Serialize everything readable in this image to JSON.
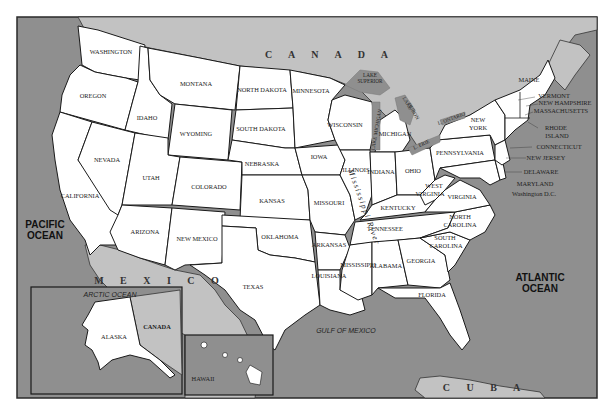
{
  "map": {
    "title": "United States",
    "colors": {
      "water": "#8f8f8f",
      "foreign_land": "#c2c2c2",
      "states": "#ffffff",
      "border": "#1a1a1a"
    },
    "countries": {
      "canada": "C A N A D A",
      "mexico": "M E X I C O",
      "cuba": "C U B A"
    },
    "oceans": {
      "pacific_line1": "PACIFIC",
      "pacific_line2": "OCEAN",
      "atlantic_line1": "ATLANTIC",
      "atlantic_line2": "OCEAN",
      "gulf": "GULF OF MEXICO"
    },
    "lakes": {
      "superior_line1": "LAKE",
      "superior_line2": "SUPERIOR",
      "michigan": "LAKE MICHIGAN",
      "huron_line1": "LAKE",
      "huron_line2": "HURON",
      "erie": "L. ERIE",
      "ontario": "L. ONTARIO"
    },
    "river": "Mississippi River",
    "states": {
      "washington": "WASHINGTON",
      "oregon": "OREGON",
      "california": "CALIFORNIA",
      "idaho": "IDAHO",
      "nevada": "NEVADA",
      "montana": "MONTANA",
      "wyoming": "WYOMING",
      "utah": "UTAH",
      "colorado": "COLORADO",
      "arizona": "ARIZONA",
      "new_mexico": "NEW MEXICO",
      "north_dakota": "NORTH DAKOTA",
      "south_dakota": "SOUTH DAKOTA",
      "nebraska": "NEBRASKA",
      "kansas": "KANSAS",
      "oklahoma": "OKLAHOMA",
      "texas": "TEXAS",
      "minnesota": "MINNESOTA",
      "iowa": "IOWA",
      "missouri": "MISSOURI",
      "arkansas": "ARKANSAS",
      "louisiana": "LOUISIANA",
      "wisconsin": "WISCONSIN",
      "illinois": "ILLINOIS",
      "michigan": "MICHIGAN",
      "indiana": "INDIANA",
      "ohio": "OHIO",
      "kentucky": "KENTUCKY",
      "tennessee": "TENNESSEE",
      "mississippi": "MISSISSIPPI",
      "alabama": "ALABAMA",
      "georgia": "GEORGIA",
      "florida": "FLORIDA",
      "south_carolina_line1": "SOUTH",
      "south_carolina_line2": "CAROLINA",
      "north_carolina_line1": "NORTH",
      "north_carolina_line2": "CAROLINA",
      "virginia": "VIRGINIA",
      "west_virginia_line1": "WEST",
      "west_virginia_line2": "VIRGINIA",
      "pennsylvania": "PENNSYLVANIA",
      "new_york_line1": "NEW",
      "new_york_line2": "YORK",
      "maine": "MAINE",
      "vermont": "VERMONT",
      "new_hampshire": "NEW HAMPSHIRE",
      "massachusetts": "MASSACHUSETTS",
      "rhode_island_line1": "RHODE",
      "rhode_island_line2": "ISLAND",
      "connecticut": "CONNECTICUT",
      "new_jersey": "NEW JERSEY",
      "delaware": "DELAWARE",
      "maryland": "MARYLAND",
      "washington_dc": "Washington D.C."
    },
    "insets": {
      "alaska": {
        "state": "ALASKA",
        "ocean": "ARCTIC OCEAN",
        "country": "CANADA"
      },
      "hawaii": {
        "state": "HAWAII"
      }
    }
  }
}
